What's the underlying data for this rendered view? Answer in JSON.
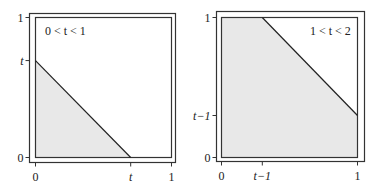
{
  "panels": [
    {
      "id": "left",
      "condition_label": "0 < t < 1",
      "y_ticks": [
        {
          "value": 1,
          "label": "1"
        },
        {
          "value": 0.6923,
          "label": "t"
        },
        {
          "value": 0,
          "label": "0"
        }
      ],
      "x_ticks": [
        {
          "value": 0,
          "label": "0"
        },
        {
          "value": 0.7,
          "label": "t"
        },
        {
          "value": 1,
          "label": "1"
        }
      ],
      "region": {
        "description": "triangle x + y < t",
        "vertices": [
          [
            0,
            0
          ],
          [
            0.7,
            0
          ],
          [
            0,
            0.6923
          ]
        ]
      },
      "boundary_line": [
        [
          0,
          0.6923
        ],
        [
          0.7,
          0
        ]
      ]
    },
    {
      "id": "right",
      "condition_label": "1 < t < 2",
      "y_ticks": [
        {
          "value": 1,
          "label": "1"
        },
        {
          "value": 0.3,
          "label": "t−1"
        },
        {
          "value": 0,
          "label": "0"
        }
      ],
      "x_ticks": [
        {
          "value": 0,
          "label": "0"
        },
        {
          "value": 0.3,
          "label": "t−1"
        },
        {
          "value": 1,
          "label": "1"
        }
      ],
      "region": {
        "description": "unit square minus corner x + y > t",
        "vertices": [
          [
            0,
            0
          ],
          [
            1,
            0
          ],
          [
            1,
            0.3
          ],
          [
            0.3,
            1
          ],
          [
            0,
            1
          ]
        ]
      },
      "boundary_line": [
        [
          0.3,
          1
        ],
        [
          1,
          0.3
        ]
      ]
    }
  ],
  "colors": {
    "fill": "#e8e8e8",
    "line": "#222222",
    "frame": "#333333"
  }
}
